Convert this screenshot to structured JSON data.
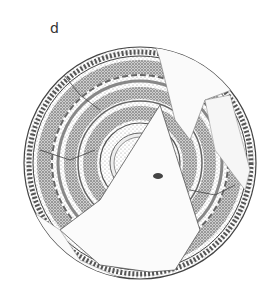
{
  "figure": {
    "label": "d",
    "colors": {
      "ink": "#3a3a3a",
      "stipple": "#8a8a8a",
      "paper": "#ffffff",
      "blank_fragment": "#f7f7f7"
    }
  }
}
